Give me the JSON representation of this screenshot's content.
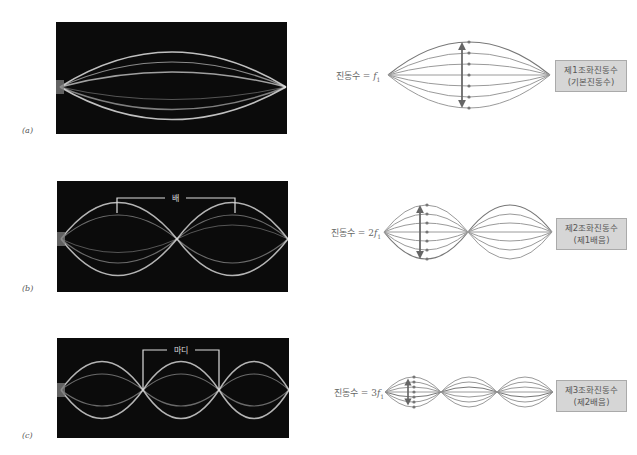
{
  "panels": [
    {
      "id": "a",
      "label": "(a)",
      "photo_annotation": "",
      "frequency_label_prefix": "진동수 = ",
      "frequency_multiplier": "",
      "frequency_symbol": "f",
      "frequency_subscript": "1",
      "harmonic_line1": "제1조화진동수",
      "harmonic_line2": "(기본진동수)",
      "loops": 1
    },
    {
      "id": "b",
      "label": "(b)",
      "photo_annotation": "배",
      "frequency_label_prefix": "진동수 = ",
      "frequency_multiplier": "2",
      "frequency_symbol": "f",
      "frequency_subscript": "1",
      "harmonic_line1": "제2조화진동수",
      "harmonic_line2": "(제1배음)",
      "loops": 2
    },
    {
      "id": "c",
      "label": "(c)",
      "photo_annotation": "마디",
      "frequency_label_prefix": "진동수 = ",
      "frequency_multiplier": "3",
      "frequency_symbol": "f",
      "frequency_subscript": "1",
      "harmonic_line1": "제3조화진동수",
      "harmonic_line2": "(제2배음)",
      "loops": 3
    }
  ],
  "colors": {
    "photo_bg": "#0b0b0b",
    "string_glow": "#e8e8e8",
    "diagram_lines": "#9a9a9a",
    "diagram_top_line": "#777777",
    "arrow": "#666666",
    "box_fill": "#d6d6d6",
    "box_border": "#aaaaaa",
    "text": "#666666"
  }
}
